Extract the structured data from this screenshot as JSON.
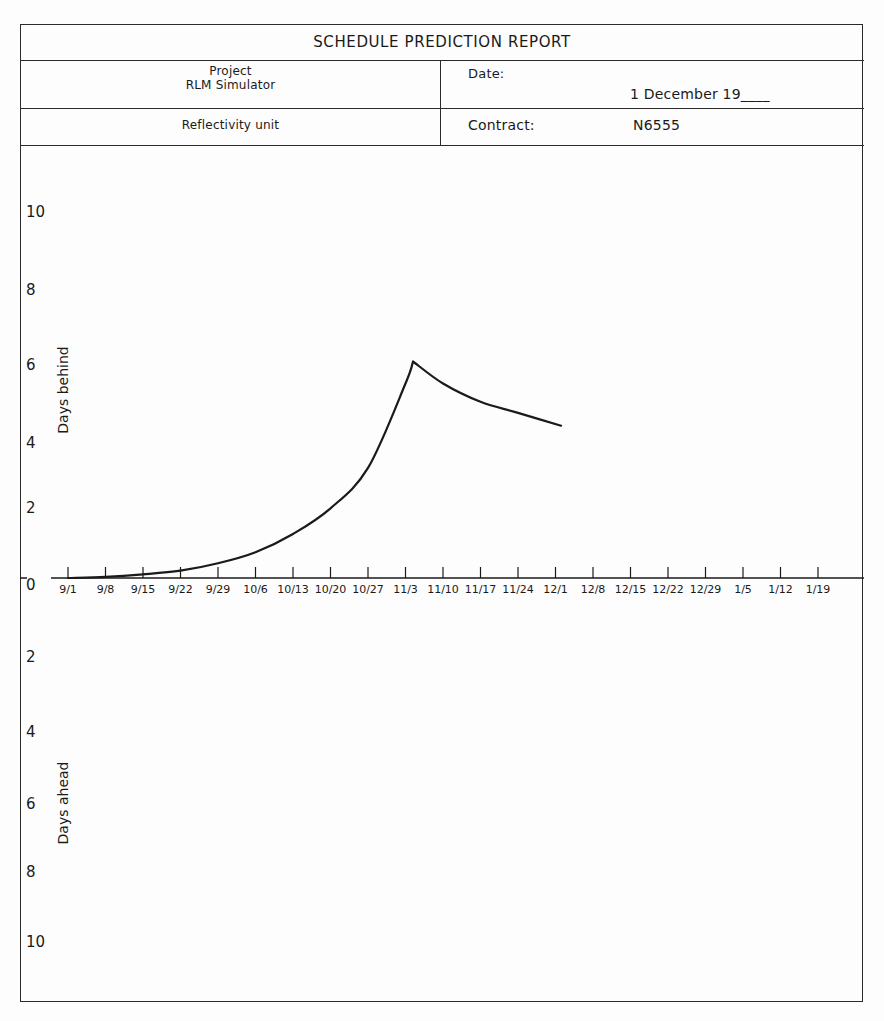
{
  "header": {
    "title": "SCHEDULE PREDICTION REPORT",
    "project_label": "Project",
    "project_name": "RLM Simulator",
    "unit": "Reflectivity unit",
    "date_label": "Date:",
    "date_value": "1 December 19____",
    "contract_label": "Contract:",
    "contract_value": "N6555"
  },
  "chart_data": {
    "type": "line",
    "title": "SCHEDULE PREDICTION REPORT",
    "xlabel": "",
    "ylabel_upper": "Days behind",
    "ylabel_lower": "Days ahead",
    "x_tick_labels": [
      "9/1",
      "9/8",
      "9/15",
      "9/22",
      "9/29",
      "10/6",
      "10/13",
      "10/20",
      "10/27",
      "11/3",
      "11/10",
      "11/17",
      "11/24",
      "12/1",
      "12/8",
      "12/15",
      "12/22",
      "12/29",
      "1/5",
      "1/12",
      "1/19"
    ],
    "y_tick_labels_upper": [
      "10",
      "8",
      "6",
      "4",
      "2",
      "0"
    ],
    "y_tick_labels_lower": [
      "2",
      "4",
      "6",
      "8",
      "10"
    ],
    "ylim": [
      -10,
      10
    ],
    "grid": false,
    "legend": null,
    "series": [
      {
        "name": "Schedule deviation (days behind)",
        "x_week_index": [
          0,
          1,
          2,
          3,
          4,
          5,
          6,
          7,
          8,
          9,
          9.2,
          10,
          11,
          12,
          13.15
        ],
        "x": [
          "9/1",
          "9/8",
          "9/15",
          "9/22",
          "9/29",
          "10/6",
          "10/13",
          "10/20",
          "10/27",
          "11/3",
          "~11/4",
          "11/10",
          "11/17",
          "11/24",
          "~12/2"
        ],
        "values": [
          0,
          0.03,
          0.1,
          0.2,
          0.4,
          0.7,
          1.2,
          1.9,
          3.0,
          5.3,
          5.9,
          5.3,
          4.8,
          4.5,
          4.15
        ]
      }
    ]
  },
  "colors": {
    "ink": "#1a1a1a",
    "paper": "#fdfdfd"
  }
}
